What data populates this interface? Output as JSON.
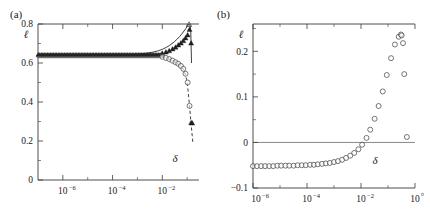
{
  "figure": {
    "panels": [
      {
        "key": "a",
        "label": "(a)",
        "xlabel": "δ",
        "ylabel": "ℓ"
      },
      {
        "key": "b",
        "label": "(b)",
        "xlabel": "δ",
        "ylabel": "ℓ"
      }
    ]
  },
  "chart_data": [
    {
      "type": "scatter",
      "panel": "(a)",
      "title": "",
      "xlabel": "δ",
      "ylabel": "ℓ",
      "xscale": "log",
      "yscale": "linear",
      "xlim": [
        1e-07,
        0.3
      ],
      "ylim": [
        0.0,
        0.8
      ],
      "grid": false,
      "legend": false,
      "xticks": [
        1e-06,
        0.0001,
        0.01
      ],
      "xtick_labels": [
        "10−6",
        "10−4",
        "10−2"
      ],
      "yticks": [
        0.0,
        0.2,
        0.4,
        0.6,
        0.8
      ],
      "ytick_labels": [
        "0",
        "0.2",
        "0.4",
        "0.6",
        "0.8"
      ],
      "yticks_minor": [
        0.1,
        0.3,
        0.5,
        0.7
      ],
      "series": [
        {
          "name": "upper-branch-theory",
          "style": "solid-line",
          "x": [
            1e-07,
            1e-06,
            1e-05,
            0.0001,
            0.0005,
            0.001,
            0.002,
            0.004,
            0.007,
            0.01,
            0.015,
            0.02,
            0.03,
            0.04,
            0.05,
            0.06,
            0.07,
            0.08,
            0.09,
            0.1,
            0.11,
            0.12,
            0.13,
            0.14,
            0.15
          ],
          "y": [
            0.64,
            0.64,
            0.64,
            0.641,
            0.643,
            0.645,
            0.649,
            0.655,
            0.663,
            0.67,
            0.681,
            0.691,
            0.708,
            0.723,
            0.736,
            0.748,
            0.759,
            0.769,
            0.778,
            0.788,
            0.795,
            0.799,
            0.795,
            0.76,
            0.6
          ]
        },
        {
          "name": "upper-branch-data",
          "style": "filled-triangle",
          "x": [
            0.01,
            0.014,
            0.019,
            0.026,
            0.034,
            0.044,
            0.056,
            0.07,
            0.086,
            0.105,
            0.125,
            0.145
          ],
          "y": [
            0.648,
            0.654,
            0.661,
            0.67,
            0.679,
            0.69,
            0.7,
            0.712,
            0.726,
            0.742,
            0.77,
            0.7
          ]
        },
        {
          "name": "lower-branch-data",
          "style": "open-circle",
          "x": [
            0.01,
            0.014,
            0.019,
            0.026,
            0.034,
            0.044,
            0.056,
            0.07,
            0.086,
            0.105,
            0.125,
            0.145,
            0.16
          ],
          "y": [
            0.632,
            0.626,
            0.62,
            0.612,
            0.604,
            0.596,
            0.585,
            0.57,
            0.545,
            0.5,
            0.38,
            0.292,
            0.29
          ]
        },
        {
          "name": "lower-branch-theory",
          "style": "dashed-line",
          "x": [
            0.01,
            0.015,
            0.022,
            0.03,
            0.04,
            0.052,
            0.066,
            0.08,
            0.095,
            0.11,
            0.125,
            0.14,
            0.155,
            0.17
          ],
          "y": [
            0.632,
            0.625,
            0.617,
            0.608,
            0.598,
            0.588,
            0.573,
            0.552,
            0.515,
            0.455,
            0.38,
            0.305,
            0.245,
            0.19
          ]
        },
        {
          "name": "flat-branch-band",
          "style": "dense-markers",
          "x_decades": [
            -7.3,
            -2.0
          ],
          "y": 0.64
        }
      ]
    },
    {
      "type": "scatter",
      "panel": "(b)",
      "title": "",
      "xlabel": "δ",
      "ylabel": "ℓ",
      "xscale": "log",
      "yscale": "linear",
      "xlim": [
        1e-06,
        1.0
      ],
      "ylim": [
        -0.1,
        0.26
      ],
      "grid": false,
      "legend": false,
      "zero_line": 0.0,
      "xticks": [
        1e-06,
        0.0001,
        0.01,
        1.0
      ],
      "xtick_labels": [
        "10−6",
        "10−4",
        "10−2",
        "10⁰"
      ],
      "yticks": [
        -0.1,
        0.0,
        0.1,
        0.2
      ],
      "ytick_labels": [
        "−0.1",
        "0",
        "0.1",
        "0.2"
      ],
      "yticks_minor": [
        -0.05,
        0.05,
        0.15,
        0.25
      ],
      "series": [
        {
          "name": "lyapunov-exponent",
          "style": "open-circle",
          "x": [
            1e-06,
            1.4e-06,
            2e-06,
            2.8e-06,
            4e-06,
            5.6e-06,
            8e-06,
            1.1e-05,
            1.6e-05,
            2.2e-05,
            3.2e-05,
            4.5e-05,
            6.4e-05,
            9e-05,
            0.00013,
            0.00018,
            0.00025,
            0.00036,
            0.0005,
            0.0007,
            0.001,
            0.0014,
            0.002,
            0.0028,
            0.004,
            0.0056,
            0.008,
            0.011,
            0.016,
            0.022,
            0.032,
            0.045,
            0.064,
            0.09,
            0.13,
            0.18,
            0.25,
            0.3,
            0.32
          ],
          "y": [
            -0.052,
            -0.052,
            -0.052,
            -0.052,
            -0.052,
            -0.052,
            -0.051,
            -0.051,
            -0.051,
            -0.051,
            -0.051,
            -0.05,
            -0.05,
            -0.05,
            -0.049,
            -0.049,
            -0.048,
            -0.047,
            -0.046,
            -0.045,
            -0.043,
            -0.041,
            -0.038,
            -0.034,
            -0.029,
            -0.023,
            -0.015,
            -0.005,
            0.01,
            0.028,
            0.052,
            0.08,
            0.112,
            0.148,
            0.185,
            0.215,
            0.232,
            0.237,
            0.235
          ]
        },
        {
          "name": "outlier-points",
          "style": "open-circle",
          "x": [
            0.36,
            0.4,
            0.5
          ],
          "y": [
            0.218,
            0.15,
            0.012
          ]
        }
      ]
    }
  ]
}
